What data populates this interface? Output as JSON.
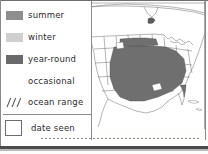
{
  "legend": {
    "items": [
      {
        "label": "summer",
        "swatch": "solid-medium-gray",
        "color": "#8e8e8e"
      },
      {
        "label": "winter",
        "swatch": "solid-light-gray",
        "color": "#cfcfcf"
      },
      {
        "label": "year-round",
        "swatch": "solid-dark-gray",
        "color": "#6a6a6a"
      },
      {
        "label": "occasional",
        "swatch": "dotted-stipple",
        "color": "#5a5a5a"
      },
      {
        "label": "ocean range",
        "swatch": "diagonal-hatch",
        "color": "#4f4f4f"
      }
    ],
    "date_seen": {
      "label": "date seen",
      "swatch": "empty-box",
      "value": ""
    }
  },
  "map": {
    "region": "North America",
    "shaded_color": "#6f6f6f",
    "outline_color": "#6a6a6a",
    "background_color": "#ffffff"
  }
}
